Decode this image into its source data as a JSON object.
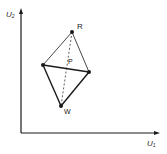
{
  "diagram": {
    "colors": {
      "ink": "#1a1a1a",
      "background": "#ffffff"
    },
    "axes": {
      "x_label": {
        "main": "U",
        "sub": "1"
      },
      "y_label": {
        "main": "U",
        "sub": "2"
      },
      "origin": [
        21,
        133
      ],
      "x_end": [
        160,
        133
      ],
      "y_end": [
        21,
        9
      ]
    },
    "points": [
      {
        "id": "R",
        "label": "R",
        "x": 72,
        "y": 32
      },
      {
        "id": "L",
        "label": "",
        "x": 43,
        "y": 65
      },
      {
        "id": "Rt",
        "label": "",
        "x": 89,
        "y": 72
      },
      {
        "id": "W",
        "label": "W",
        "x": 61,
        "y": 106
      }
    ],
    "center_label": {
      "label": "P",
      "x": 70,
      "y": 62
    },
    "edges": [
      {
        "from": "R",
        "to": "L",
        "style": "solid",
        "weight": "thin"
      },
      {
        "from": "R",
        "to": "Rt",
        "style": "solid",
        "weight": "thin"
      },
      {
        "from": "L",
        "to": "Rt",
        "style": "solid",
        "weight": "bold"
      },
      {
        "from": "L",
        "to": "W",
        "style": "solid",
        "weight": "bold"
      },
      {
        "from": "Rt",
        "to": "W",
        "style": "solid",
        "weight": "bold"
      },
      {
        "from": "R",
        "to": "W",
        "style": "dashed",
        "weight": "thin"
      }
    ]
  }
}
